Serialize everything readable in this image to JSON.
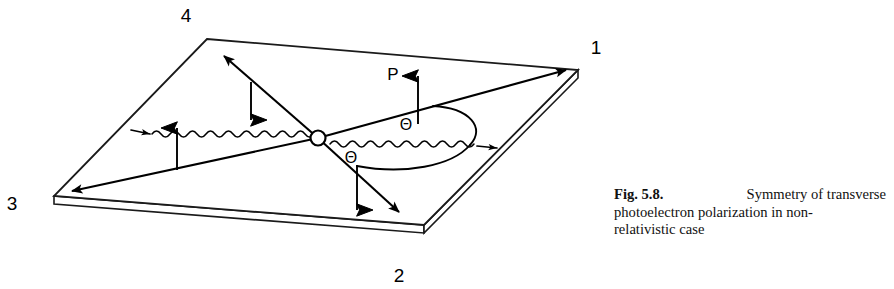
{
  "figure": {
    "caption": {
      "label": "Fig. 5.8.",
      "line1_rest": "Symmetry of transverse",
      "line2": "photoelectron polarization in non-",
      "line3": "relativistic case",
      "full_text": "Fig. 5.8. Symmetry of transverse photoelectron polarization in non-relativistic case"
    },
    "diagram": {
      "corner_labels": [
        {
          "name": "quadrant-label-4",
          "text": "4",
          "x": 186,
          "y": 22
        },
        {
          "name": "quadrant-label-1",
          "text": "1",
          "x": 596,
          "y": 54
        },
        {
          "name": "quadrant-label-3",
          "text": "3",
          "x": 10,
          "y": 210
        },
        {
          "name": "quadrant-label-2",
          "text": "2",
          "x": 397,
          "y": 281
        }
      ],
      "vector_labels": [
        {
          "name": "polarization-label-P",
          "text": "P",
          "x": 391,
          "y": 78
        }
      ],
      "angle_labels": [
        {
          "name": "angle-label-theta-upper",
          "text": "Θ",
          "x": 404,
          "y": 128
        },
        {
          "name": "angle-label-theta-lower",
          "text": "Θ",
          "x": 349,
          "y": 162
        }
      ],
      "colors": {
        "stroke": "#000000",
        "background": "#ffffff"
      },
      "geometry": {
        "plane_top": [
          207,
          39
        ],
        "plane_right": [
          578,
          70
        ],
        "plane_bottom": [
          424,
          225
        ],
        "plane_left": [
          54,
          196
        ],
        "slab_thickness": 8,
        "vertex": [
          318,
          138
        ],
        "vertex_radius": 7
      }
    }
  }
}
